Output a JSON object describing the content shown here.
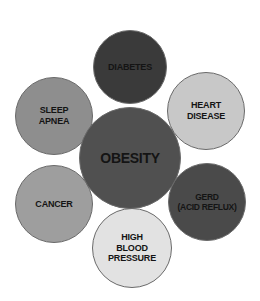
{
  "diagram": {
    "type": "hub-and-spoke bubble diagram",
    "center": {
      "id": "obesity",
      "label": "OBESITY",
      "color": "#505050",
      "cx": 130,
      "cy": 158,
      "r": 51
    },
    "satellites": [
      {
        "id": "diabetes",
        "label": "DIABETES",
        "color": "#3a3a3a",
        "cx": 130,
        "cy": 67,
        "r": 37
      },
      {
        "id": "heart-disease",
        "label": "HEART\nDISEASE",
        "color": "#c8c8c8",
        "cx": 206,
        "cy": 111,
        "r": 39
      },
      {
        "id": "gerd",
        "label": "GERD\n(ACID REFLUX)",
        "color": "#4a4a4a",
        "cx": 207,
        "cy": 202,
        "r": 39
      },
      {
        "id": "high-blood-pressure",
        "label": "HIGH\nBLOOD\nPRESSURE",
        "color": "#e2e2e2",
        "cx": 132,
        "cy": 248,
        "r": 40
      },
      {
        "id": "cancer",
        "label": "CANCER",
        "color": "#9e9e9e",
        "cx": 54,
        "cy": 204,
        "r": 39
      },
      {
        "id": "sleep-apnea",
        "label": "SLEEP\nAPNEA",
        "color": "#8e8e8e",
        "cx": 54,
        "cy": 116,
        "r": 39
      }
    ]
  }
}
